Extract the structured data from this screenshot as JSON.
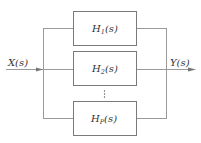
{
  "diagram": {
    "type": "parallel-connection-block-diagram",
    "input": {
      "label": "X(s)",
      "label_main": "X",
      "label_arg": "(s)"
    },
    "output": {
      "label": "Y(s)",
      "label_main": "Y",
      "label_arg": "(s)"
    },
    "blocks": [
      {
        "label": "H1(s)",
        "main": "H",
        "sub": "1",
        "arg": "(s)"
      },
      {
        "label": "H2(s)",
        "main": "H",
        "sub": "2",
        "arg": "(s)"
      },
      {
        "label": "HP(s)",
        "main": "H",
        "sub": "P",
        "arg": "(s)"
      }
    ],
    "ellipsis": "⋮",
    "colors": {
      "wire": "#9a9a9a",
      "box_border": "#7a7a7a",
      "text": "#333333"
    }
  }
}
